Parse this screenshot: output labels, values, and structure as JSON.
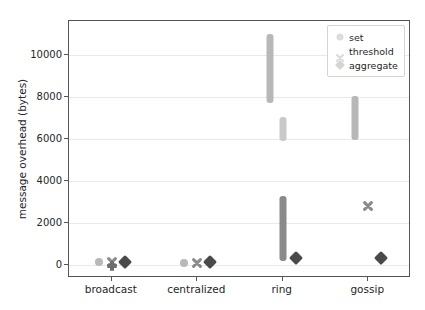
{
  "chart_data": {
    "type": "scatter",
    "title": "",
    "xlabel": "",
    "ylabel": "message overhead (bytes)",
    "categories": [
      "broadcast",
      "centralized",
      "ring",
      "gossip"
    ],
    "ylim": [
      -600,
      11600
    ],
    "yticks": [
      0,
      2000,
      4000,
      6000,
      8000,
      10000
    ],
    "ytick_labels": [
      "0",
      "2000",
      "4000",
      "6000",
      "8000",
      "10000"
    ],
    "grid": true,
    "legend_position": "upper right",
    "series": [
      {
        "name": "set",
        "marker": "circle",
        "color": "#b8b8b8",
        "points": [
          {
            "category": "broadcast",
            "low": 60,
            "high": 260,
            "center": 160
          },
          {
            "category": "centralized",
            "low": 40,
            "high": 220,
            "center": 130
          },
          {
            "category": "ring",
            "low": 7700,
            "high": 11000,
            "center": 9350
          },
          {
            "category": "gossip",
            "low": 5950,
            "high": 8050,
            "center": 7000
          }
        ]
      },
      {
        "name": "threshold",
        "marker": "x",
        "color": "#8a8a8a",
        "points": [
          {
            "category": "broadcast",
            "low": 60,
            "high": 260,
            "center": 160
          },
          {
            "category": "centralized",
            "low": 40,
            "high": 230,
            "center": 135
          },
          {
            "category": "ring",
            "low": 200,
            "high": 3300,
            "center": 1750
          },
          {
            "category": "gossip",
            "low": 2400,
            "high": 3250,
            "center": 2825
          }
        ]
      },
      {
        "name": "aggregate",
        "marker": "diamond",
        "color": "#4a4a4a",
        "points": [
          {
            "category": "broadcast",
            "low": 80,
            "high": 240,
            "center": 160
          },
          {
            "category": "centralized",
            "low": 80,
            "high": 240,
            "center": 160
          },
          {
            "category": "ring",
            "low": 180,
            "high": 520,
            "center": 350
          },
          {
            "category": "gossip",
            "low": 180,
            "high": 540,
            "center": 360
          }
        ]
      },
      {
        "name": "threshold-secondary",
        "marker": "x",
        "color": "#c9c9c9",
        "points": [
          {
            "category": "ring",
            "low": 5900,
            "high": 7050,
            "center": 6475
          }
        ]
      }
    ]
  },
  "legend": {
    "items": [
      {
        "label": "set",
        "icon": "circle-marker-icon",
        "color": "#d8d8d8"
      },
      {
        "label": "threshold",
        "icon": "x-marker-icon",
        "color": "#d8d8d8"
      },
      {
        "label": "aggregate",
        "icon": "diamond-marker-icon",
        "color": "#d0d0d0"
      }
    ]
  },
  "axes": {
    "y_label": "message overhead (bytes)",
    "y_tick_labels": [
      "10000",
      "8000",
      "6000",
      "4000",
      "2000",
      "0"
    ],
    "x_tick_labels": [
      "broadcast",
      "centralized",
      "ring",
      "gossip"
    ]
  },
  "colors": {
    "frame": "#555555",
    "grid": "#e9e9e9",
    "text": "#262626",
    "background": "#ffffff"
  }
}
